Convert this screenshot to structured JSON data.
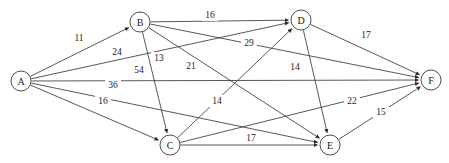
{
  "diagram": {
    "type": "directed-weighted-graph",
    "colors": {
      "stroke": "#3a3a3a",
      "node_fill": "#ffffff",
      "text": "#1a1a1a",
      "background": "#ffffff"
    },
    "nodes": [
      {
        "id": "A",
        "label": "A",
        "x": 21,
        "y": 81,
        "r": 10
      },
      {
        "id": "B",
        "label": "B",
        "x": 140,
        "y": 22,
        "r": 10
      },
      {
        "id": "C",
        "label": "C",
        "x": 170,
        "y": 145,
        "r": 10
      },
      {
        "id": "D",
        "label": "D",
        "x": 301,
        "y": 20,
        "r": 10
      },
      {
        "id": "E",
        "label": "E",
        "x": 330,
        "y": 145,
        "r": 10
      },
      {
        "id": "F",
        "label": "F",
        "x": 431,
        "y": 80,
        "r": 10
      }
    ],
    "edges": [
      {
        "from": "A",
        "to": "B",
        "weight": "11",
        "lx": 79,
        "ly": 38
      },
      {
        "from": "A",
        "to": "D",
        "weight": "24",
        "lx": 117,
        "ly": 52
      },
      {
        "from": "A",
        "to": "F",
        "weight": "54",
        "lx": 139,
        "ly": 70
      },
      {
        "from": "A",
        "to": "E",
        "weight": "36",
        "lx": 113,
        "ly": 85
      },
      {
        "from": "A",
        "to": "C",
        "weight": "16",
        "lx": 103,
        "ly": 101
      },
      {
        "from": "B",
        "to": "D",
        "weight": "16",
        "lx": 210,
        "ly": 15
      },
      {
        "from": "B",
        "to": "C",
        "weight": "13",
        "lx": 159,
        "ly": 58
      },
      {
        "from": "B",
        "to": "E",
        "weight": "21",
        "lx": 191,
        "ly": 66
      },
      {
        "from": "B",
        "to": "F",
        "weight": "29",
        "lx": 249,
        "ly": 43
      },
      {
        "from": "C",
        "to": "D",
        "weight": "14",
        "lx": 217,
        "ly": 101
      },
      {
        "from": "C",
        "to": "F",
        "weight": "22",
        "lx": 352,
        "ly": 101
      },
      {
        "from": "C",
        "to": "E",
        "weight": "17",
        "lx": 251,
        "ly": 138
      },
      {
        "from": "D",
        "to": "F",
        "weight": "17",
        "lx": 366,
        "ly": 35
      },
      {
        "from": "D",
        "to": "E",
        "weight": "14",
        "lx": 295,
        "ly": 67
      },
      {
        "from": "E",
        "to": "F",
        "weight": "15",
        "lx": 381,
        "ly": 112
      }
    ]
  }
}
